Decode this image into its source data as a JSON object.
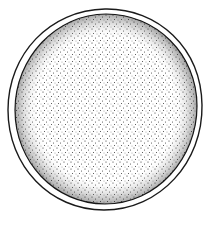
{
  "image": {
    "subject": "stippled circular cell / egg illustration",
    "background_color": "#ffffff",
    "ink_color": "#1a1a1a",
    "outer_membrane": {
      "cx": 105,
      "cy": 109,
      "rx": 96,
      "ry": 100
    },
    "inner_body": {
      "cx": 106,
      "cy": 109,
      "rx": 90,
      "ry": 94
    }
  }
}
